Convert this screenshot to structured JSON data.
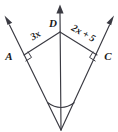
{
  "figure": {
    "type": "geometry-diagram",
    "background_color": "#ffffff",
    "stroke_color": "#3a3a42",
    "label_color": "#1a1a1a",
    "vertices": [
      {
        "id": "A",
        "label": "A",
        "x": 24,
        "y": 55
      },
      {
        "id": "D",
        "label": "D",
        "x": 60,
        "y": 32
      },
      {
        "id": "C",
        "label": "C",
        "x": 97,
        "y": 55
      }
    ],
    "measures": [
      {
        "id": "AD",
        "label": "3x",
        "segment": "A-D"
      },
      {
        "id": "DC",
        "label": "2x + 5",
        "segment": "D-C"
      }
    ],
    "marks": {
      "right_angle_at_A": true,
      "right_angle_at_C": true,
      "angle_arc_at_vertex": true,
      "arrow_top_left": true,
      "arrow_top_center": true,
      "arrow_top_right": true
    }
  }
}
